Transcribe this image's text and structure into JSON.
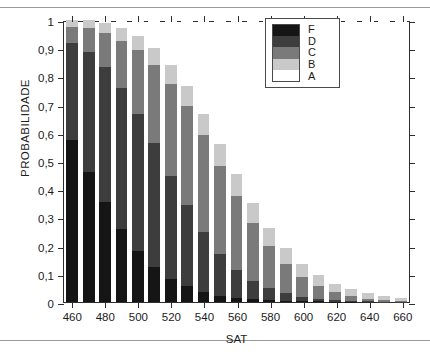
{
  "chart_data": {
    "type": "bar",
    "stacked": true,
    "title": "",
    "xlabel": "SAT",
    "ylabel": "PROBABILIDADE",
    "xlim": [
      455,
      665
    ],
    "ylim": [
      0,
      1
    ],
    "grid": false,
    "legend_position": "upper-right",
    "ytick_labels": [
      "0",
      "0,1",
      "0,2",
      "0,3",
      "0,4",
      "0,5",
      "0,6",
      "0,7",
      "0,8",
      "0,9",
      "1"
    ],
    "ytick_values": [
      0,
      0.1,
      0.2,
      0.3,
      0.4,
      0.5,
      0.6,
      0.7,
      0.8,
      0.9,
      1
    ],
    "xtick_labels": [
      "460",
      "480",
      "500",
      "520",
      "540",
      "560",
      "580",
      "600",
      "620",
      "640",
      "660"
    ],
    "xtick_values": [
      460,
      480,
      500,
      520,
      540,
      560,
      580,
      600,
      620,
      640,
      660
    ],
    "categories": [
      460,
      470,
      480,
      490,
      500,
      510,
      520,
      530,
      540,
      550,
      560,
      570,
      580,
      590,
      600,
      610,
      620,
      630,
      640,
      650,
      660
    ],
    "series": [
      {
        "name": "F",
        "color": "#151515",
        "values": [
          0.575,
          0.46,
          0.355,
          0.258,
          0.18,
          0.124,
          0.081,
          0.056,
          0.035,
          0.022,
          0.015,
          0.01,
          0.007,
          0.005,
          0.003,
          0.002,
          0.001,
          0.001,
          0.0,
          0.0,
          0.0
        ]
      },
      {
        "name": "D",
        "color": "#3d3d3d",
        "values": [
          0.345,
          0.428,
          0.478,
          0.502,
          0.487,
          0.44,
          0.367,
          0.288,
          0.212,
          0.15,
          0.1,
          0.065,
          0.041,
          0.026,
          0.016,
          0.01,
          0.006,
          0.004,
          0.002,
          0.001,
          0.001
        ]
      },
      {
        "name": "C",
        "color": "#7a7a7a",
        "values": [
          0.055,
          0.082,
          0.12,
          0.166,
          0.226,
          0.276,
          0.326,
          0.351,
          0.344,
          0.31,
          0.262,
          0.205,
          0.15,
          0.105,
          0.07,
          0.045,
          0.028,
          0.017,
          0.01,
          0.006,
          0.003
        ]
      },
      {
        "name": "B",
        "color": "#c9c9c9",
        "values": [
          0.025,
          0.03,
          0.037,
          0.044,
          0.052,
          0.06,
          0.066,
          0.072,
          0.076,
          0.078,
          0.077,
          0.072,
          0.065,
          0.055,
          0.046,
          0.038,
          0.03,
          0.025,
          0.019,
          0.014,
          0.01
        ]
      },
      {
        "name": "A",
        "color": "#ffffff",
        "values": [
          0.0,
          0.0,
          0.01,
          0.03,
          0.055,
          0.1,
          0.16,
          0.233,
          0.333,
          0.44,
          0.546,
          0.648,
          0.737,
          0.809,
          0.865,
          0.905,
          0.935,
          0.953,
          0.969,
          0.979,
          0.986
        ]
      }
    ],
    "bar_totals": [
      1.0,
      1.0,
      0.99,
      0.97,
      0.945,
      0.9,
      0.84,
      0.767,
      0.667,
      0.56,
      0.454,
      0.352,
      0.263,
      0.191,
      0.135,
      0.095,
      0.065,
      0.047,
      0.031,
      0.021,
      0.014
    ],
    "legend": [
      {
        "label": "F",
        "color": "#151515"
      },
      {
        "label": "D",
        "color": "#3d3d3d"
      },
      {
        "label": "C",
        "color": "#7a7a7a"
      },
      {
        "label": "B",
        "color": "#c9c9c9"
      },
      {
        "label": "A",
        "color": "#ffffff"
      }
    ]
  }
}
